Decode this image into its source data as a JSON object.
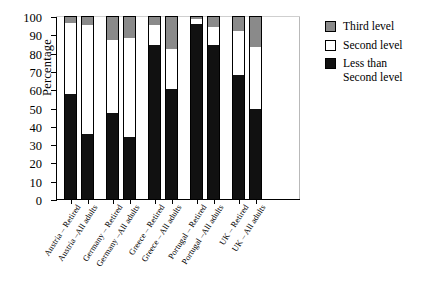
{
  "chart_data": {
    "type": "bar",
    "subtype": "stacked-bar-vertical-100pct",
    "title": "",
    "xlabel": "",
    "ylabel": "Percentage",
    "ylim": [
      0,
      100
    ],
    "yticks": [
      0,
      10,
      20,
      30,
      40,
      50,
      60,
      70,
      80,
      90,
      100
    ],
    "grid": false,
    "legend_position": "right",
    "categories": [
      "Austria – Retired",
      "Austria –All adults",
      "Germany – Retired",
      "Germany –All adults",
      "Greece – Retired",
      "Greece – All adults",
      "Portugal – Retired",
      "Portugal –All adults",
      "UK – Retired",
      "UK – All adults"
    ],
    "series": [
      {
        "name": "Less than Second level",
        "color": "#111111",
        "values": [
          57.5,
          35.5,
          47.0,
          34.0,
          84.0,
          60.0,
          95.5,
          84.0,
          68.0,
          49.0
        ]
      },
      {
        "name": "Second level",
        "color": "#ffffff",
        "values": [
          38.5,
          59.5,
          40.0,
          54.0,
          11.0,
          22.0,
          3.0,
          10.0,
          24.0,
          34.0
        ]
      },
      {
        "name": "Third level",
        "color": "#8a8a8a",
        "values": [
          4.0,
          5.0,
          13.0,
          12.0,
          5.0,
          18.0,
          1.5,
          6.0,
          8.0,
          17.0
        ]
      }
    ],
    "cumulative_tops": {
      "less_than_second": [
        57.5,
        35.5,
        47.0,
        34.0,
        84.0,
        60.0,
        95.5,
        84.0,
        68.0,
        49.0
      ],
      "second": [
        96.0,
        95.0,
        87.0,
        88.0,
        95.0,
        82.0,
        98.5,
        94.0,
        92.0,
        83.0
      ],
      "third": [
        100,
        100,
        100,
        100,
        100,
        100,
        100,
        100,
        100,
        100
      ]
    }
  },
  "legend": {
    "items": [
      {
        "label": "Third level",
        "key": "third"
      },
      {
        "label": "Second level",
        "key": "second"
      },
      {
        "label": "Less than\nSecond level",
        "key": "low"
      }
    ]
  },
  "colors": {
    "third_level": "#8a8a8a",
    "second_level": "#ffffff",
    "less_than_second_level": "#111111",
    "axis": "#000000",
    "background": "#ffffff"
  }
}
